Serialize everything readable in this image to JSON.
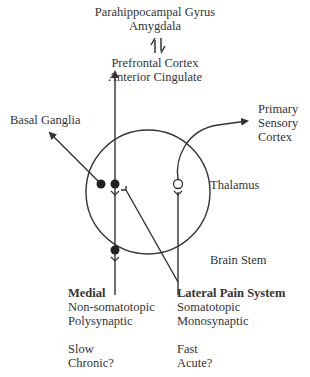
{
  "labels": {
    "top1": "Parahippocampal Gyrus",
    "top2": "Amygdala",
    "prefrontal1": "Prefrontal Cortex",
    "prefrontal2": "Anterior Cingulate",
    "basal": "Basal Ganglia",
    "primary1": "Primary",
    "primary2": "Sensory",
    "primary3": "Cortex",
    "thalamus": "Thalamus",
    "brainstem": "Brain Stem"
  },
  "medial": {
    "title": "Medial",
    "line1": "Non-somatotopic",
    "line2": "Polysynaptic",
    "line3": "Slow",
    "line4": "Chronic?"
  },
  "lateral": {
    "title": "Lateral Pain System",
    "line1": "Somatotopic",
    "line2": "Monosynaptic",
    "line3": "Fast",
    "line4": "Acute?"
  },
  "colors": {
    "stroke": "#333333",
    "background": "#ffffff"
  }
}
